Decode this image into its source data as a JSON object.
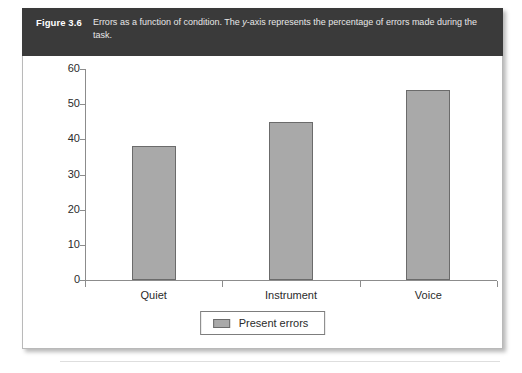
{
  "figure": {
    "label": "Figure 3.6",
    "caption_part1": "Errors as a function of condition. The ",
    "caption_italic": "y",
    "caption_part2": "-axis represents the percentage of errors made during the task."
  },
  "colors": {
    "header_background": "#3a3a3a",
    "bar_fill": "#a9a9a9",
    "bar_border": "#6b6b6b",
    "axis": "#8c8c8c",
    "panel_border": "#b9b9b9"
  },
  "legend": {
    "position": "bottom-center",
    "entries": [
      {
        "label": "Present errors",
        "color": "#a9a9a9"
      }
    ]
  },
  "chart_data": {
    "type": "bar",
    "title": "",
    "subtitle": "",
    "categories": [
      "Quiet",
      "Instrument",
      "Voice"
    ],
    "values": [
      38,
      45,
      54
    ],
    "series": [
      {
        "name": "Present errors",
        "values": [
          38,
          45,
          54
        ]
      }
    ],
    "xlabel": "",
    "ylabel": "",
    "ylim": [
      0,
      60
    ],
    "yticks": [
      0,
      10,
      20,
      30,
      40,
      50,
      60
    ],
    "ytick_labels": [
      "0",
      "10",
      "20",
      "30",
      "40",
      "50",
      "60"
    ],
    "grid": false,
    "legend_position": "bottom-center"
  }
}
